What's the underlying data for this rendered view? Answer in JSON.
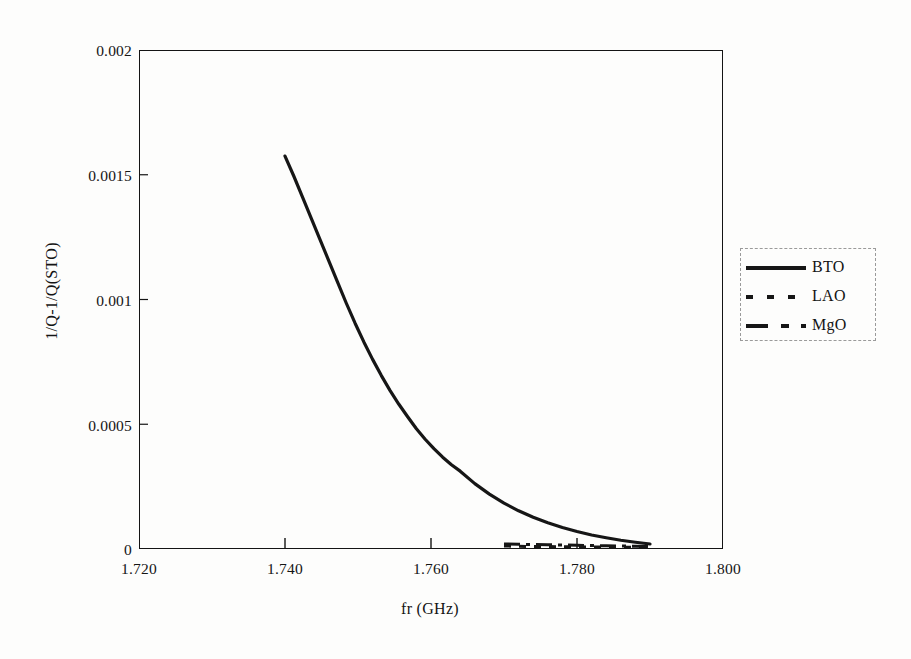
{
  "chart_data": {
    "type": "line",
    "title": "",
    "xlabel": "fr (GHz)",
    "ylabel": "1/Q-1/Q(STO)",
    "xlim": [
      1.72,
      1.8
    ],
    "ylim": [
      0,
      0.002
    ],
    "xticks": [
      "1.720",
      "1.740",
      "1.760",
      "1.780",
      "1.800"
    ],
    "xtick_values": [
      1.72,
      1.74,
      1.76,
      1.78,
      1.8
    ],
    "yticks": [
      "0",
      "0.0005",
      "0.001",
      "0.0015",
      "0.002"
    ],
    "ytick_values": [
      0,
      0.0005,
      0.001,
      0.0015,
      0.002
    ],
    "grid": false,
    "legend_position": "right-outside",
    "series": [
      {
        "name": "BTO",
        "style": "solid",
        "linewidth": 3.2,
        "color": "#161616",
        "x": [
          1.74,
          1.7412,
          1.7424,
          1.7436,
          1.7448,
          1.746,
          1.7472,
          1.7484,
          1.7496,
          1.7508,
          1.752,
          1.7532,
          1.7544,
          1.7556,
          1.7568,
          1.758,
          1.7592,
          1.7604,
          1.7616,
          1.7628,
          1.764,
          1.766,
          1.768,
          1.77,
          1.772,
          1.774,
          1.776,
          1.778,
          1.78,
          1.782,
          1.784,
          1.786,
          1.788,
          1.79
        ],
        "y": [
          0.001575,
          0.001495,
          0.00141,
          0.001325,
          0.00124,
          0.001155,
          0.00107,
          0.000985,
          0.000905,
          0.00083,
          0.00076,
          0.000695,
          0.000635,
          0.00058,
          0.00053,
          0.000482,
          0.00044,
          0.000402,
          0.000368,
          0.000338,
          0.000312,
          0.000262,
          0.00022,
          0.000184,
          0.000153,
          0.000127,
          0.000105,
          8.6e-05,
          7e-05,
          5.6e-05,
          4.5e-05,
          3.5e-05,
          2.7e-05,
          2e-05
        ]
      },
      {
        "name": "LAO",
        "style": "dotted",
        "linewidth": 3.0,
        "color": "#161616",
        "x": [
          1.77,
          1.772,
          1.774,
          1.776,
          1.778,
          1.78,
          1.782,
          1.784,
          1.786,
          1.788,
          1.79
        ],
        "y": [
          1.2e-05,
          1.1e-05,
          1e-05,
          1e-05,
          9e-06,
          9e-06,
          8e-06,
          8e-06,
          7e-06,
          7e-06,
          6e-06
        ]
      },
      {
        "name": "MgO",
        "style": "dash-dot",
        "linewidth": 3.0,
        "color": "#161616",
        "x": [
          1.77,
          1.772,
          1.774,
          1.776,
          1.778,
          1.78,
          1.782,
          1.784,
          1.786,
          1.788,
          1.79
        ],
        "y": [
          2e-05,
          1.9e-05,
          1.8e-05,
          1.7e-05,
          1.6e-05,
          1.5e-05,
          1.4e-05,
          1.3e-05,
          1.2e-05,
          1.1e-05,
          1e-05
        ]
      }
    ]
  },
  "legend": {
    "entries": [
      {
        "label": "BTO",
        "style": "solid"
      },
      {
        "label": "LAO",
        "style": "dotted"
      },
      {
        "label": "MgO",
        "style": "dash-dot"
      }
    ]
  }
}
